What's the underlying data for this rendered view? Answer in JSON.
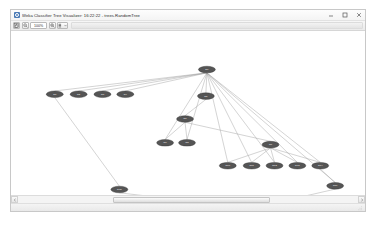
{
  "window": {
    "title": "Weka Classifier Tree Visualizer: 16:22:22 - trees.RandomTree",
    "app_icon": "weka-icon",
    "controls": {
      "minimize": "minimize-icon",
      "maximize": "maximize-icon",
      "close": "close-icon"
    }
  },
  "toolbar": {
    "buttons": [
      {
        "name": "save-button",
        "icon": "save-icon",
        "label": ""
      },
      {
        "name": "zoom-out-button",
        "icon": "zoom-out-icon",
        "label": ""
      }
    ],
    "zoom_value": "100%",
    "zoom_label": "100%",
    "right_buttons": [
      {
        "name": "zoom-in-button",
        "icon": "zoom-in-icon",
        "label": ""
      },
      {
        "name": "layout-menu-button",
        "icon": "layout-icon",
        "label": ""
      }
    ]
  },
  "graph": {
    "type": "tree",
    "background": "#ffffff",
    "node_fill": "#555555",
    "node_stroke": "#2e2e2e",
    "edge_color": "#9a9a9a",
    "nodes": [
      {
        "id": "n0",
        "label": "N0",
        "x": 197,
        "y": 41
      },
      {
        "id": "n1",
        "label": "N1",
        "x": 44,
        "y": 68
      },
      {
        "id": "n2",
        "label": "N2",
        "x": 68,
        "y": 68
      },
      {
        "id": "n3",
        "label": "N3",
        "x": 92,
        "y": 68
      },
      {
        "id": "n4",
        "label": "N4",
        "x": 115,
        "y": 68
      },
      {
        "id": "n5",
        "label": "N5",
        "x": 196,
        "y": 70
      },
      {
        "id": "n6",
        "label": "N6",
        "x": 175,
        "y": 95
      },
      {
        "id": "n7",
        "label": "N7",
        "x": 155,
        "y": 121
      },
      {
        "id": "n8",
        "label": "N8",
        "x": 177,
        "y": 121
      },
      {
        "id": "n9",
        "label": "N9",
        "x": 261,
        "y": 123
      },
      {
        "id": "n10",
        "label": "N10",
        "x": 218,
        "y": 146
      },
      {
        "id": "n11",
        "label": "N11",
        "x": 242,
        "y": 146
      },
      {
        "id": "n12",
        "label": "N12",
        "x": 265,
        "y": 146
      },
      {
        "id": "n13",
        "label": "N13",
        "x": 288,
        "y": 146
      },
      {
        "id": "n14",
        "label": "N14",
        "x": 311,
        "y": 146
      },
      {
        "id": "n15",
        "label": "N15",
        "x": 109,
        "y": 172
      },
      {
        "id": "n16",
        "label": "N16",
        "x": 326,
        "y": 168
      },
      {
        "id": "n17",
        "label": "N17",
        "x": 242,
        "y": 196
      }
    ],
    "edges": [
      [
        "n0",
        "n1"
      ],
      [
        "n0",
        "n2"
      ],
      [
        "n0",
        "n3"
      ],
      [
        "n0",
        "n4"
      ],
      [
        "n0",
        "n5"
      ],
      [
        "n0",
        "n7"
      ],
      [
        "n0",
        "n8"
      ],
      [
        "n0",
        "n10"
      ],
      [
        "n0",
        "n11"
      ],
      [
        "n0",
        "n12"
      ],
      [
        "n0",
        "n13"
      ],
      [
        "n0",
        "n14"
      ],
      [
        "n0",
        "n16"
      ],
      [
        "n5",
        "n6"
      ],
      [
        "n6",
        "n7"
      ],
      [
        "n6",
        "n8"
      ],
      [
        "n6",
        "n9"
      ],
      [
        "n9",
        "n10"
      ],
      [
        "n9",
        "n11"
      ],
      [
        "n9",
        "n12"
      ],
      [
        "n9",
        "n13"
      ],
      [
        "n9",
        "n14"
      ],
      [
        "n14",
        "n16"
      ],
      [
        "n1",
        "n15"
      ],
      [
        "n15",
        "n17"
      ],
      [
        "n16",
        "n17"
      ]
    ]
  },
  "scrollbar": {
    "left_arrow": "arrow-left-icon",
    "right_arrow": "arrow-right-icon",
    "thumb_start_pct": 28,
    "thumb_width_pct": 46
  },
  "status": {
    "text": "",
    "grip": "resize-grip-icon"
  }
}
